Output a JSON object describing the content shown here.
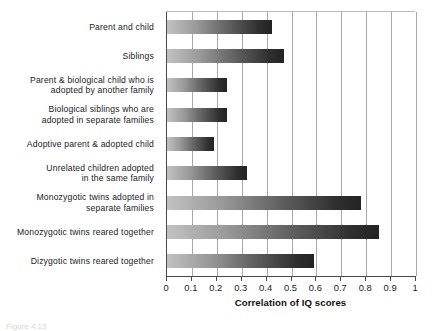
{
  "chart_data": {
    "type": "bar",
    "orientation": "horizontal",
    "title": "",
    "xlabel": "Correlation of IQ scores",
    "ylabel": "",
    "xlim": [
      0,
      1
    ],
    "xticks": [
      "0",
      "0.1",
      "0.2",
      "0.3",
      "0.4",
      "0.5",
      "0.6",
      "0.7",
      "0.8",
      "0.9",
      "1"
    ],
    "xtick_values": [
      0,
      0.1,
      0.2,
      0.3,
      0.4,
      0.5,
      0.6,
      0.7,
      0.8,
      0.9,
      1
    ],
    "grid": "vertical",
    "legend": "none",
    "categories": [
      "Parent and child",
      "Siblings",
      "Parent & biological child who is adopted by another family",
      "Biological siblings who are adopted in separate families",
      "Adoptive parent & adopted child",
      "Unrelated children adopted in the same family",
      "Monozygotic twins adopted in separate families",
      "Monozygotic twins reared together",
      "Dizygotic twins reared together"
    ],
    "category_lines": [
      [
        "Parent and child"
      ],
      [
        "Siblings"
      ],
      [
        "Parent & biological child who is",
        "adopted by another family"
      ],
      [
        "Biological siblings who are",
        "adopted in separate families"
      ],
      [
        "Adoptive parent & adopted child"
      ],
      [
        "Unrelated children adopted",
        "in the same family"
      ],
      [
        "Monozygotic twins adopted in",
        "separate families"
      ],
      [
        "Monozygotic twins reared together"
      ],
      [
        "Dizygotic twins reared together"
      ]
    ],
    "values": [
      0.42,
      0.47,
      0.24,
      0.24,
      0.19,
      0.32,
      0.78,
      0.85,
      0.59
    ],
    "bar_gradient": {
      "from": "#c2c2c2",
      "to": "#232323"
    },
    "axis_color": "#4a4a4a",
    "gridline_color": "#a8a8a8"
  },
  "caption": {
    "text": "Figure 4.13"
  }
}
